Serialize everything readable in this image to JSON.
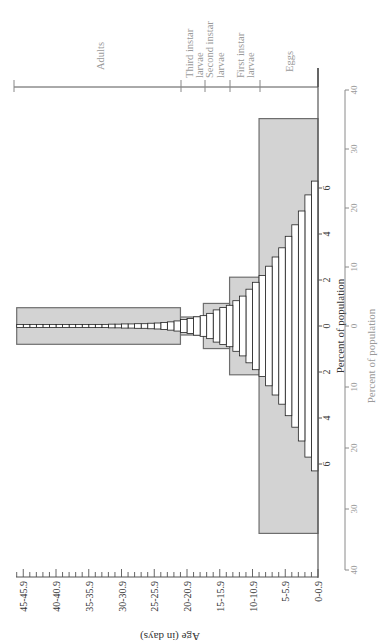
{
  "chart_data": {
    "type": "bar",
    "orientation": "population-pyramid (figure rotated 90° counter-clockwise)",
    "title": "",
    "xlabel": "Age (in days)",
    "ylabel": "Percent of population",
    "inner_axis": {
      "label": "Percent of population",
      "ticks": [
        "6",
        "4",
        "2",
        "0",
        "2",
        "4",
        "6"
      ],
      "tick_values": [
        -6,
        -4,
        -2,
        0,
        2,
        4,
        6
      ]
    },
    "outer_axis": {
      "label": "Percent of population",
      "ticks": [
        "40",
        "30",
        "20",
        "10",
        "0",
        "10",
        "20",
        "30",
        "40"
      ],
      "tick_values": [
        -40,
        -30,
        -20,
        -10,
        0,
        10,
        20,
        30,
        40
      ]
    },
    "age_axis": {
      "label": "Age (in days)",
      "tick_labels": [
        "0-0.9",
        "5-5.9",
        "10-10.9",
        "15-15.9",
        "20-20.9",
        "25-25.9",
        "30-30.9",
        "35-35.9",
        "40-40.9",
        "45-45.9"
      ],
      "range": [
        0,
        46
      ]
    },
    "stages": [
      {
        "name": "Eggs",
        "age_start": 0,
        "age_end": 9,
        "total_percent": 34
      },
      {
        "name": "First instar larvae",
        "age_start": 9,
        "age_end": 13.5,
        "total_percent": 8
      },
      {
        "name": "Second instar larvae",
        "age_start": 13.5,
        "age_end": 17.5,
        "total_percent": 3.7
      },
      {
        "name": "Third instar larvae",
        "age_start": 17.5,
        "age_end": 21,
        "total_percent": 1
      },
      {
        "name": "Adults",
        "age_start": 21,
        "age_end": 46,
        "total_percent": 3
      }
    ],
    "categories": [
      "0",
      "1",
      "2",
      "3",
      "4",
      "5",
      "6",
      "7",
      "8",
      "9",
      "10",
      "11",
      "12",
      "13",
      "14",
      "15",
      "16",
      "17",
      "18",
      "19",
      "20",
      "21",
      "22",
      "23",
      "24",
      "25",
      "26",
      "27",
      "28",
      "29",
      "30",
      "31",
      "32",
      "33",
      "34",
      "35",
      "36",
      "37",
      "38",
      "39",
      "40",
      "41",
      "42",
      "43",
      "44",
      "45"
    ],
    "series": [
      {
        "name": "Percent of population per day (each side)",
        "values": [
          6.3,
          5.7,
          5.0,
          4.4,
          3.9,
          3.4,
          3.0,
          2.6,
          2.2,
          1.9,
          1.6,
          1.3,
          1.1,
          0.9,
          0.8,
          0.7,
          0.55,
          0.45,
          0.4,
          0.33,
          0.28,
          0.22,
          0.18,
          0.15,
          0.13,
          0.12,
          0.1,
          0.1,
          0.09,
          0.09,
          0.08,
          0.08,
          0.07,
          0.07,
          0.07,
          0.06,
          0.06,
          0.06,
          0.05,
          0.05,
          0.05,
          0.05,
          0.04,
          0.04,
          0.04,
          0.04
        ]
      }
    ],
    "legend": [],
    "grid": false
  },
  "labels": {
    "adults": "Adults",
    "third_instar": "Third instar larvae",
    "third_instar_line1": "Third instar",
    "third_instar_line2": "larvae",
    "second_instar_line1": "Second instar",
    "second_instar_line2": "larvae",
    "first_instar_line1": "First instar",
    "first_instar_line2": "larvae",
    "eggs": "Eggs",
    "inner_axis_title": "Percent of population",
    "outer_axis_title": "Percent of population",
    "age_axis_title": "Age (in days)"
  },
  "colors": {
    "stage_box_fill": "#d3d3d3",
    "stage_box_stroke": "#6e6e6e",
    "bar_fill": "#ffffff",
    "bar_stroke": "#222222",
    "axis": "#555555",
    "faint_text": "#9a9a9a",
    "text": "#333333"
  }
}
